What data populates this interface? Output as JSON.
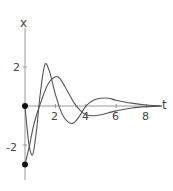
{
  "chart_data": {
    "type": "line",
    "title": "",
    "xlabel": "t",
    "ylabel": "x",
    "xlim": [
      0,
      9
    ],
    "ylim": [
      -3.5,
      4.5
    ],
    "xticks": [
      2,
      4,
      6,
      8
    ],
    "yticks": [
      2,
      -2
    ],
    "xtick_labels": [
      "2",
      "4",
      "6",
      "8"
    ],
    "ytick_labels": [
      "2",
      "-2"
    ],
    "grid": false,
    "legend": null,
    "series": [
      {
        "name": "curve starting at x=0",
        "x": [
          0,
          0.25,
          0.5,
          0.75,
          1.0,
          1.3,
          1.6,
          2.0,
          2.5,
          3.1,
          3.6,
          4.0,
          4.5,
          5.0,
          5.5,
          6.0,
          7.0,
          8.0,
          9.0
        ],
        "y": [
          0,
          -1.9,
          -2.5,
          -1.3,
          0.6,
          2.1,
          1.8,
          0.6,
          -0.5,
          -0.9,
          -0.5,
          0.0,
          0.3,
          0.4,
          0.4,
          0.3,
          0.15,
          0.05,
          0.0
        ]
      },
      {
        "name": "curve starting at x=-3",
        "x": [
          0,
          0.3,
          0.6,
          1.0,
          1.5,
          2.0,
          2.3,
          2.7,
          3.2,
          3.6,
          4.0,
          4.5,
          5.0,
          5.5,
          6.0,
          7.0,
          8.0,
          9.0
        ],
        "y": [
          -3.0,
          -2.0,
          -0.9,
          0.1,
          1.1,
          1.5,
          1.4,
          0.9,
          0.2,
          -0.2,
          -0.45,
          -0.5,
          -0.45,
          -0.35,
          -0.25,
          -0.1,
          -0.03,
          0.0
        ]
      }
    ],
    "points": [
      {
        "x": 0,
        "y": 0
      },
      {
        "x": 0,
        "y": -3
      }
    ]
  },
  "axis_labels": {
    "x": "t",
    "y": "x"
  },
  "tick_labels": {
    "x": [
      "2",
      "4",
      "6",
      "8"
    ],
    "y_pos": "2",
    "y_neg": "-2"
  }
}
